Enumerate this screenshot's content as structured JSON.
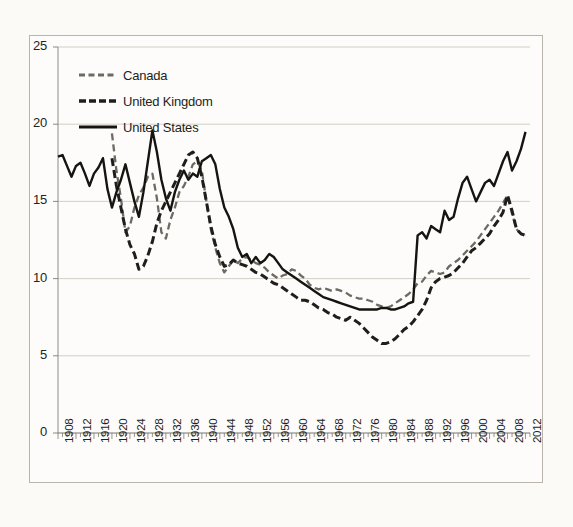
{
  "chart_data": {
    "type": "line",
    "title": "",
    "subtitle": "",
    "xlabel": "",
    "ylabel": "",
    "xlim": [
      1908,
      2013
    ],
    "ylim": [
      0,
      25
    ],
    "y_ticks": [
      0,
      5,
      10,
      15,
      20,
      25
    ],
    "grid": "horizontal",
    "legend_position": "top-left",
    "x_tick_labels": [
      "1908",
      "1912",
      "1916",
      "1920",
      "1924",
      "1928",
      "1932",
      "1936",
      "1940",
      "1944",
      "1948",
      "1952",
      "1956",
      "1960",
      "1964",
      "1968",
      "1972",
      "1976",
      "1980",
      "1984",
      "1988",
      "1992",
      "1996",
      "2000",
      "2004",
      "2008",
      "2012"
    ],
    "series": [
      {
        "name": "Canada",
        "style": "dashed",
        "color": "#6e6a63",
        "x": [
          1920,
          1921,
          1922,
          1923,
          1924,
          1925,
          1926,
          1927,
          1928,
          1929,
          1930,
          1931,
          1932,
          1933,
          1934,
          1935,
          1936,
          1937,
          1938,
          1939,
          1940,
          1941,
          1942,
          1943,
          1944,
          1945,
          1946,
          1947,
          1948,
          1949,
          1950,
          1951,
          1952,
          1953,
          1954,
          1955,
          1956,
          1957,
          1958,
          1959,
          1960,
          1961,
          1962,
          1963,
          1964,
          1965,
          1966,
          1967,
          1968,
          1969,
          1970,
          1971,
          1972,
          1973,
          1974,
          1975,
          1976,
          1977,
          1978,
          1979,
          1980,
          1981,
          1982,
          1983,
          1984,
          1985,
          1986,
          1987,
          1988,
          1989,
          1990,
          1991,
          1992,
          1993,
          1994,
          1995,
          1996,
          1997,
          1998,
          1999,
          2000,
          2001,
          2002,
          2003,
          2004,
          2005,
          2006,
          2007,
          2008,
          2009,
          2010,
          2011,
          2012
        ],
        "values": [
          19.4,
          17.0,
          15.2,
          13.0,
          13.4,
          14.6,
          15.4,
          15.9,
          16.6,
          16.8,
          15.2,
          13.0,
          12.6,
          13.8,
          14.6,
          15.6,
          16.0,
          16.6,
          17.4,
          17.6,
          17.0,
          15.0,
          13.2,
          12.0,
          11.0,
          10.4,
          10.8,
          11.2,
          11.0,
          11.3,
          11.4,
          11.2,
          11.0,
          10.9,
          10.7,
          10.4,
          10.2,
          10.0,
          10.2,
          10.3,
          10.6,
          10.5,
          10.2,
          10.0,
          9.6,
          9.4,
          9.3,
          9.4,
          9.3,
          9.2,
          9.3,
          9.2,
          9.1,
          8.9,
          8.8,
          8.7,
          8.7,
          8.6,
          8.5,
          8.3,
          8.2,
          8.1,
          8.2,
          8.4,
          8.6,
          8.8,
          9.0,
          9.3,
          9.7,
          9.8,
          10.2,
          10.5,
          10.4,
          10.3,
          10.4,
          10.8,
          11.0,
          11.2,
          11.5,
          11.8,
          12.1,
          12.4,
          12.8,
          13.2,
          13.6,
          14.0,
          14.4,
          14.9,
          15.4,
          14.2,
          13.2,
          12.9,
          12.8
        ]
      },
      {
        "name": "United Kingdom",
        "style": "dashed-bold",
        "color": "#211d1a",
        "x": [
          1920,
          1921,
          1922,
          1923,
          1924,
          1925,
          1926,
          1927,
          1928,
          1929,
          1930,
          1931,
          1932,
          1933,
          1934,
          1935,
          1936,
          1937,
          1938,
          1939,
          1940,
          1941,
          1942,
          1943,
          1944,
          1945,
          1946,
          1947,
          1948,
          1949,
          1950,
          1951,
          1952,
          1953,
          1954,
          1955,
          1956,
          1957,
          1958,
          1959,
          1960,
          1961,
          1962,
          1963,
          1964,
          1965,
          1966,
          1967,
          1968,
          1969,
          1970,
          1971,
          1972,
          1973,
          1974,
          1975,
          1976,
          1977,
          1978,
          1979,
          1980,
          1981,
          1982,
          1983,
          1984,
          1985,
          1986,
          1987,
          1988,
          1989,
          1990,
          1991,
          1992,
          1993,
          1994,
          1995,
          1996,
          1997,
          1998,
          1999,
          2000,
          2001,
          2002,
          2003,
          2004,
          2005,
          2006,
          2007,
          2008,
          2009,
          2010,
          2011,
          2012
        ],
        "values": [
          17.8,
          16.0,
          14.6,
          13.2,
          12.2,
          11.6,
          10.6,
          10.8,
          11.5,
          12.4,
          13.6,
          14.4,
          15.0,
          15.6,
          16.2,
          16.8,
          17.4,
          18.0,
          18.2,
          17.8,
          16.6,
          15.0,
          13.4,
          12.2,
          11.4,
          10.8,
          10.9,
          11.2,
          11.0,
          10.9,
          10.8,
          10.6,
          10.4,
          10.3,
          10.1,
          9.9,
          9.7,
          9.6,
          9.4,
          9.2,
          9.0,
          8.8,
          8.6,
          8.6,
          8.5,
          8.3,
          8.1,
          8.0,
          7.8,
          7.7,
          7.5,
          7.4,
          7.3,
          7.5,
          7.3,
          7.1,
          6.8,
          6.5,
          6.2,
          6.0,
          5.8,
          5.8,
          5.9,
          6.1,
          6.4,
          6.7,
          6.9,
          7.2,
          7.6,
          8.0,
          8.6,
          9.4,
          9.8,
          10.0,
          10.1,
          10.2,
          10.4,
          10.7,
          11.0,
          11.4,
          11.8,
          12.0,
          12.3,
          12.6,
          12.9,
          13.4,
          13.8,
          14.3,
          15.4,
          14.4,
          13.2,
          12.9,
          12.8
        ]
      },
      {
        "name": "United States",
        "style": "solid",
        "color": "#161310",
        "x": [
          1908,
          1909,
          1910,
          1911,
          1912,
          1913,
          1914,
          1915,
          1916,
          1917,
          1918,
          1919,
          1920,
          1921,
          1922,
          1923,
          1924,
          1925,
          1926,
          1927,
          1928,
          1929,
          1930,
          1931,
          1932,
          1933,
          1934,
          1935,
          1936,
          1937,
          1938,
          1939,
          1940,
          1941,
          1942,
          1943,
          1944,
          1945,
          1946,
          1947,
          1948,
          1949,
          1950,
          1951,
          1952,
          1953,
          1954,
          1955,
          1956,
          1957,
          1958,
          1959,
          1960,
          1961,
          1962,
          1963,
          1964,
          1965,
          1966,
          1967,
          1968,
          1969,
          1970,
          1971,
          1972,
          1973,
          1974,
          1975,
          1976,
          1977,
          1978,
          1979,
          1980,
          1981,
          1982,
          1983,
          1984,
          1985,
          1986,
          1987,
          1988,
          1989,
          1990,
          1991,
          1992,
          1993,
          1994,
          1995,
          1996,
          1997,
          1998,
          1999,
          2000,
          2001,
          2002,
          2003,
          2004,
          2005,
          2006,
          2007,
          2008,
          2009,
          2010,
          2011,
          2012
        ],
        "values": [
          17.9,
          18.0,
          17.3,
          16.6,
          17.3,
          17.5,
          16.8,
          16.0,
          16.8,
          17.2,
          17.8,
          15.8,
          14.6,
          15.6,
          16.4,
          17.4,
          16.2,
          15.0,
          14.0,
          15.6,
          17.6,
          19.6,
          18.2,
          16.4,
          15.2,
          14.4,
          15.6,
          16.4,
          17.0,
          16.4,
          16.8,
          16.6,
          17.6,
          17.8,
          18.0,
          17.4,
          15.8,
          14.6,
          14.0,
          13.2,
          12.0,
          11.4,
          11.6,
          11.0,
          11.4,
          11.0,
          11.2,
          11.6,
          11.4,
          11.0,
          10.6,
          10.4,
          10.2,
          10.0,
          9.8,
          9.6,
          9.4,
          9.2,
          9.0,
          8.8,
          8.7,
          8.6,
          8.5,
          8.4,
          8.3,
          8.2,
          8.1,
          8.0,
          8.0,
          8.0,
          8.0,
          8.0,
          8.1,
          8.1,
          8.0,
          8.0,
          8.1,
          8.2,
          8.4,
          8.5,
          12.8,
          13.0,
          12.6,
          13.4,
          13.2,
          13.0,
          14.4,
          13.8,
          14.0,
          15.2,
          16.2,
          16.6,
          15.8,
          15.0,
          15.6,
          16.2,
          16.4,
          16.0,
          16.8,
          17.6,
          18.2,
          17.0,
          17.6,
          18.4,
          19.5
        ]
      }
    ]
  },
  "legend": {
    "items": [
      {
        "label": "Canada"
      },
      {
        "label": "United Kingdom"
      },
      {
        "label": "United States"
      }
    ]
  }
}
